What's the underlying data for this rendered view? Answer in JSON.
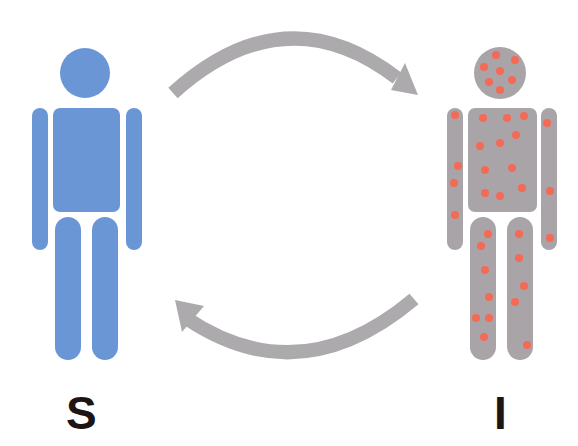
{
  "diagram": {
    "type": "SI compartment model",
    "nodes": [
      {
        "id": "S",
        "label": "S",
        "meaning": "susceptible",
        "fill": "#6a96d6"
      },
      {
        "id": "I",
        "label": "I",
        "meaning": "infected",
        "fill": "#a8a4a8",
        "spot_color": "#f56a56"
      }
    ],
    "edges": [
      {
        "from": "S",
        "to": "I",
        "direction": "top arc, pointing right"
      },
      {
        "from": "I",
        "to": "S",
        "direction": "bottom arc, pointing left"
      }
    ],
    "arrow_color": "#acaaac",
    "label_color": "#1e1414"
  }
}
